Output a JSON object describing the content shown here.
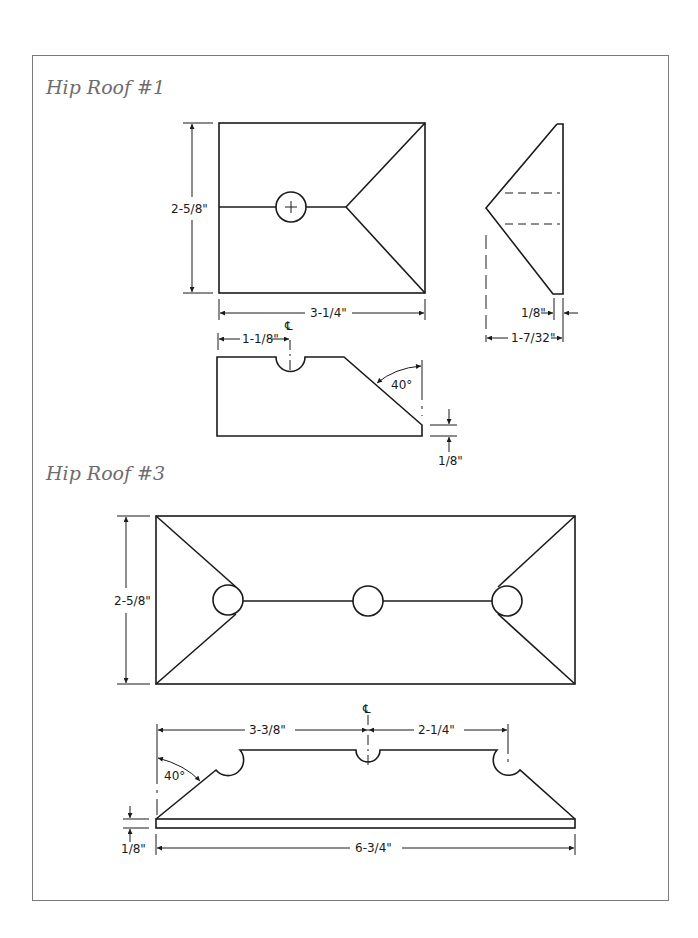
{
  "sections": [
    {
      "title": "Hip Roof #1",
      "plan_view": {
        "height_dim": "2-5/8\"",
        "width_dim": "3-1/4\""
      },
      "side_view": {
        "thickness_dim": "1/8\"",
        "depth_dim": "1-7/32\""
      },
      "front_view": {
        "centerline_offset_dim": "1-1/8\"",
        "centerline_mark": "℄",
        "angle_dim": "40°",
        "base_thickness_dim": "1/8\""
      }
    },
    {
      "title": "Hip Roof #3",
      "plan_view": {
        "height_dim": "2-5/8\""
      },
      "front_view": {
        "left_to_center_dim": "3-3/8\"",
        "center_to_right_dim": "2-1/4\"",
        "centerline_mark": "℄",
        "angle_dim": "40°",
        "base_thickness_dim": "1/8\"",
        "overall_width_dim": "6-3/4\""
      }
    }
  ]
}
